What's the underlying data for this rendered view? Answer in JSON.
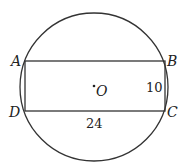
{
  "figure": {
    "type": "geometry",
    "circle": {
      "center_label": "O",
      "cx": 94,
      "cy": 87,
      "r": 74
    },
    "rectangle": {
      "vertices": [
        {
          "label": "A",
          "x": 25,
          "y": 61
        },
        {
          "label": "B",
          "x": 165,
          "y": 61
        },
        {
          "label": "C",
          "x": 165,
          "y": 111
        },
        {
          "label": "D",
          "x": 25,
          "y": 111
        }
      ],
      "side_lengths": {
        "DC": "24",
        "BC": "10"
      }
    },
    "labels": {
      "A": "A",
      "B": "B",
      "C": "C",
      "D": "D",
      "O": "O",
      "width": "24",
      "height": "10"
    },
    "colors": {
      "stroke": "#333333",
      "background": "#ffffff"
    }
  }
}
